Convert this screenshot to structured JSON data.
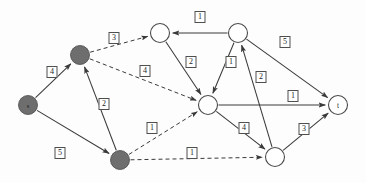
{
  "diagram": {
    "type": "directed-network-flow-graph",
    "title": "",
    "background_color": "#fdfdfd",
    "node_filled_color": "#6e6e6e",
    "node_open_color": "#ffffff",
    "edge_color": "#3a3a3a",
    "label_border_color": "#4f4f4f",
    "nodes": [
      {
        "id": "s",
        "label": "s",
        "style": "filled",
        "x": 28,
        "y": 105,
        "r": 9.5
      },
      {
        "id": "n1",
        "label": "",
        "style": "filled",
        "x": 80,
        "y": 55,
        "r": 9.5
      },
      {
        "id": "n5",
        "label": "",
        "style": "filled",
        "x": 120,
        "y": 160,
        "r": 9.5
      },
      {
        "id": "n2",
        "label": "",
        "style": "open",
        "x": 160,
        "y": 33,
        "r": 9.5
      },
      {
        "id": "n3",
        "label": "",
        "style": "open",
        "x": 238,
        "y": 33,
        "r": 9.5
      },
      {
        "id": "center",
        "label": "",
        "style": "open",
        "x": 208,
        "y": 105,
        "r": 9.5
      },
      {
        "id": "n6",
        "label": "",
        "style": "open",
        "x": 275,
        "y": 157,
        "r": 9.5
      },
      {
        "id": "t",
        "label": "t",
        "style": "open",
        "x": 338,
        "y": 105,
        "r": 9.5
      }
    ],
    "edges": [
      {
        "from": "s",
        "to": "n1",
        "capacity": "4",
        "style": "solid",
        "label_x": 52,
        "label_y": 72
      },
      {
        "from": "s",
        "to": "n5",
        "capacity": "5",
        "style": "solid",
        "label_x": 60,
        "label_y": 153
      },
      {
        "from": "n5",
        "to": "n1",
        "capacity": "2",
        "style": "solid",
        "label_x": 104,
        "label_y": 104
      },
      {
        "from": "n1",
        "to": "n2",
        "capacity": "3",
        "style": "dashed",
        "label_x": 114,
        "label_y": 38
      },
      {
        "from": "n1",
        "to": "center",
        "capacity": "4",
        "style": "dashed",
        "label_x": 145,
        "label_y": 71
      },
      {
        "from": "n5",
        "to": "center",
        "capacity": "1",
        "style": "dashed",
        "label_x": 152,
        "label_y": 128
      },
      {
        "from": "n5",
        "to": "n6",
        "capacity": "1",
        "style": "dashed",
        "label_x": 192,
        "label_y": 153
      },
      {
        "from": "n3",
        "to": "n2",
        "capacity": "1",
        "style": "solid",
        "label_x": 200,
        "label_y": 17
      },
      {
        "from": "n2",
        "to": "center",
        "capacity": "2",
        "style": "solid",
        "label_x": 191,
        "label_y": 62
      },
      {
        "from": "n3",
        "to": "center",
        "capacity": "1",
        "style": "solid",
        "label_x": 231,
        "label_y": 62
      },
      {
        "from": "n6",
        "to": "n3",
        "capacity": "2",
        "style": "solid",
        "label_x": 261,
        "label_y": 77
      },
      {
        "from": "n3",
        "to": "t",
        "capacity": "5",
        "style": "solid",
        "label_x": 285,
        "label_y": 42
      },
      {
        "from": "center",
        "to": "t",
        "capacity": "1",
        "style": "solid",
        "label_x": 293,
        "label_y": 96
      },
      {
        "from": "center",
        "to": "n6",
        "capacity": "4",
        "style": "solid",
        "label_x": 244,
        "label_y": 128
      },
      {
        "from": "n6",
        "to": "t",
        "capacity": "3",
        "style": "solid",
        "label_x": 304,
        "label_y": 129
      }
    ]
  }
}
